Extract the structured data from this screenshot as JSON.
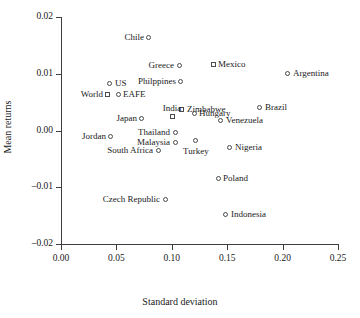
{
  "chart_data": {
    "type": "scatter",
    "title": "",
    "xlabel": "Standard deviation",
    "ylabel": "Mean returns",
    "xlim": [
      0.0,
      0.25
    ],
    "ylim": [
      -0.02,
      0.02
    ],
    "xticks": [
      "0.00",
      "0.05",
      "0.10",
      "0.15",
      "0.20",
      "0.25"
    ],
    "xtick_values": [
      0.0,
      0.05,
      0.1,
      0.15,
      0.2,
      0.25
    ],
    "yticks": [
      "0.02",
      "0.01",
      "0.00",
      "–0.01",
      "–0.02"
    ],
    "ytick_values": [
      0.02,
      0.01,
      0.0,
      -0.01,
      -0.02
    ],
    "grid": false,
    "legend": "none",
    "points": [
      {
        "label": "Chile",
        "x": 0.0794,
        "y": 0.0163,
        "marker": "circle",
        "label_pos": "lab-left"
      },
      {
        "label": "Greece",
        "x": 0.1065,
        "y": 0.01137,
        "marker": "circle",
        "label_pos": "lab-left"
      },
      {
        "label": "Mexico",
        "x": 0.1372,
        "y": 0.01155,
        "marker": "square",
        "label_pos": "lab-right"
      },
      {
        "label": "Argentina",
        "x": 0.2048,
        "y": 0.00996,
        "marker": "circle",
        "label_pos": "lab-right"
      },
      {
        "label": "Philppines",
        "x": 0.1083,
        "y": 0.00863,
        "marker": "circle",
        "label_pos": "lab-left"
      },
      {
        "label": "US",
        "x": 0.0442,
        "y": 0.00837,
        "marker": "circle",
        "label_pos": "lab-right"
      },
      {
        "label": "World",
        "x": 0.0424,
        "y": 0.00643,
        "marker": "square",
        "label_pos": "lab-left"
      },
      {
        "label": "EAFE",
        "x": 0.0515,
        "y": 0.00626,
        "marker": "circle",
        "label_pos": "lab-right"
      },
      {
        "label": "Zimbabwe",
        "x": 0.1092,
        "y": 0.0037,
        "marker": "square",
        "label_pos": "lab-right"
      },
      {
        "label": "Brazil",
        "x": 0.1796,
        "y": 0.00414,
        "marker": "circle",
        "label_pos": "lab-right"
      },
      {
        "label": "Hungary",
        "x": 0.1201,
        "y": 0.00308,
        "marker": "circle",
        "label_pos": "lab-right"
      },
      {
        "label": "India",
        "x": 0.1002,
        "y": 0.00238,
        "marker": "square",
        "label_pos": "lab-above"
      },
      {
        "label": "Venezuela",
        "x": 0.1444,
        "y": 0.00185,
        "marker": "circle",
        "label_pos": "lab-right"
      },
      {
        "label": "Japan",
        "x": 0.0731,
        "y": 0.0022,
        "marker": "circle",
        "label_pos": "lab-left"
      },
      {
        "label": "Thailand",
        "x": 0.1029,
        "y": -0.00044,
        "marker": "circle",
        "label_pos": "lab-left"
      },
      {
        "label": "Jordan",
        "x": 0.0451,
        "y": -0.00097,
        "marker": "circle",
        "label_pos": "lab-left"
      },
      {
        "label": "Malaysia",
        "x": 0.1029,
        "y": -0.00203,
        "marker": "circle",
        "label_pos": "lab-left"
      },
      {
        "label": "Turkey",
        "x": 0.1218,
        "y": -0.00185,
        "marker": "circle",
        "label_pos": "lab-below"
      },
      {
        "label": "Nigeria",
        "x": 0.1525,
        "y": -0.00291,
        "marker": "circle",
        "label_pos": "lab-right"
      },
      {
        "label": "South Africa",
        "x": 0.0876,
        "y": -0.00344,
        "marker": "circle",
        "label_pos": "lab-left"
      },
      {
        "label": "Poland",
        "x": 0.1417,
        "y": -0.00854,
        "marker": "circle",
        "label_pos": "lab-right"
      },
      {
        "label": "Czech Republic",
        "x": 0.0939,
        "y": -0.01218,
        "marker": "circle",
        "label_pos": "lab-left"
      },
      {
        "label": "Indonesia",
        "x": 0.1489,
        "y": -0.01482,
        "marker": "circle",
        "label_pos": "lab-right"
      }
    ]
  }
}
